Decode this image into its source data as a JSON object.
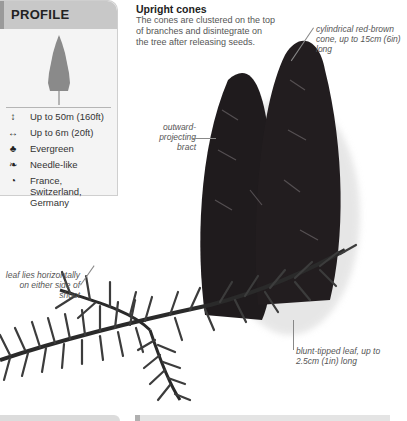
{
  "profile": {
    "title": "PROFILE",
    "facts": [
      {
        "icon": "height-icon",
        "glyph": "↕",
        "text": "Up to 50m (160ft)"
      },
      {
        "icon": "spread-icon",
        "glyph": "↔",
        "text": "Up to 6m (20ft)"
      },
      {
        "icon": "evergreen-icon",
        "glyph": "♣",
        "text": "Evergreen"
      },
      {
        "icon": "leaf-icon",
        "glyph": "❧",
        "text": "Needle-like"
      },
      {
        "icon": "globe-icon",
        "glyph": "◔",
        "text": "France, Switzerland, Germany"
      }
    ]
  },
  "feature": {
    "heading": "Upright cones",
    "body": "The cones are clustered on the top of branches and disintegrate on the tree after releasing seeds."
  },
  "annotations": {
    "cone": "cylindrical red-brown cone, up to 15cm (6in) long",
    "bract": "outward-projecting bract",
    "leaf_position": "leaf lies horizontally on either side of shoot",
    "leaf_tip": "blunt-tipped leaf, up to 2.5cm (1in) long"
  },
  "colors": {
    "profile_header": "#c8c8c8",
    "profile_bg": "#f4f4f4",
    "cone": "#1e1a1c",
    "needles": "#3a3a3a"
  }
}
